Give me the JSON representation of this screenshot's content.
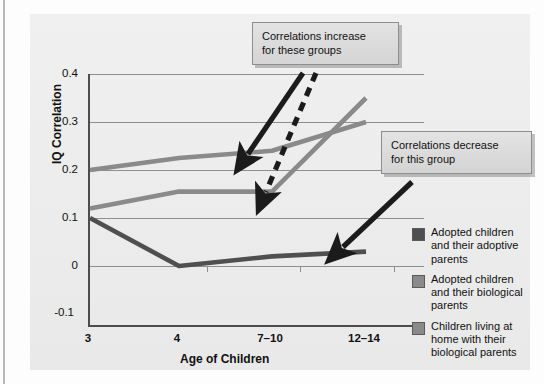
{
  "chart_data": {
    "type": "line",
    "title": "",
    "xlabel": "Age of Children",
    "ylabel": "IQ Correlation",
    "categories": [
      "3",
      "4",
      "7–10",
      "12–14"
    ],
    "ytick_labels": [
      "0.4",
      "0.3",
      "0.2",
      "0.1",
      "0",
      "-0.1"
    ],
    "ylim": [
      -0.1,
      0.4
    ],
    "grid": true,
    "legend_position": "right",
    "series": [
      {
        "name": "Adopted children and their adoptive parents",
        "color": "#4f4f4f",
        "values": [
          0.1,
          0.0,
          0.02,
          0.03
        ]
      },
      {
        "name": "Adopted children and their biological parents",
        "color": "#8a8a8a",
        "values": [
          0.12,
          0.155,
          0.155,
          0.35
        ]
      },
      {
        "name": "Children living at home with their biological parents",
        "color": "#8a8a8a",
        "values": [
          0.2,
          0.225,
          0.24,
          0.3
        ]
      }
    ],
    "annotations": [
      {
        "id": "increase",
        "line1": "Correlations increase",
        "line2": "for these groups",
        "arrows": [
          "solid",
          "dashed"
        ]
      },
      {
        "id": "decrease",
        "line1": "Correlations decrease",
        "line2": "for this group",
        "arrows": [
          "solid"
        ]
      }
    ]
  },
  "axis": {
    "y_title": "IQ Correlation",
    "x_title": "Age of Children",
    "y_ticks": [
      "0.4",
      "0.3",
      "0.2",
      "0.1",
      "0",
      "-0.1"
    ],
    "x_ticks": [
      "3",
      "4",
      "7–10",
      "12–14"
    ]
  },
  "callouts": {
    "increase": {
      "line1": "Correlations increase",
      "line2": "for these groups"
    },
    "decrease": {
      "line1": "Correlations decrease",
      "line2": "for this group"
    }
  },
  "legend": {
    "items": [
      {
        "label": "Adopted children and their adoptive parents",
        "swatch": "#4f4f4f"
      },
      {
        "label": "Adopted children and their biological parents",
        "swatch": "#8a8a8a"
      },
      {
        "label": "Children living at home with their biological parents",
        "swatch": "#8a8a8a"
      }
    ]
  }
}
